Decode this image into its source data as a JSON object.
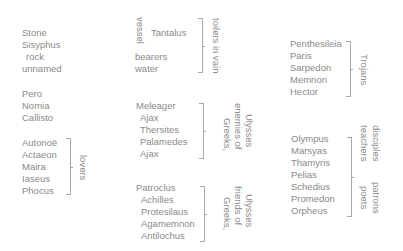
{
  "groups": {
    "sisyphus": {
      "items": [
        "Stone",
        "Sisyphus",
        "rock",
        "unnamed"
      ]
    },
    "women": {
      "items": [
        "Pero",
        "Nomia",
        "Callisto"
      ]
    },
    "lovers": {
      "items": [
        "Autonoë",
        "Actaeon",
        "Maira",
        "Iaseus",
        "Phocus"
      ],
      "label": "lovers"
    },
    "toilers": {
      "vessel": "vessel",
      "items": [
        "Tantalus",
        "bearers",
        "water"
      ],
      "label": "toilers in vain"
    },
    "enemies": {
      "items": [
        "Meleager",
        "Ajax",
        "Thersites",
        "Palamedes",
        "Ajax"
      ],
      "label_lines": [
        "Greeks,",
        "enemies of",
        "Ulysses"
      ]
    },
    "friends": {
      "items": [
        "Patroclus",
        "Achilles",
        "Protesilaus",
        "Agamemnon",
        "Antilochus"
      ],
      "label_lines": [
        "Greeks,",
        "friends of",
        "Ulysses"
      ]
    },
    "trojans": {
      "items": [
        "Penthesileia",
        "Paris",
        "Sarpedon",
        "Memnon",
        "Hector"
      ],
      "label": "Trojans"
    },
    "poets": {
      "items": [
        "Olympus",
        "Marsyas",
        "Thamyris",
        "Pelias",
        "Schedius",
        "Promedon",
        "Orpheus"
      ],
      "labels_top": [
        "teachers",
        "disciples"
      ],
      "labels_bottom": [
        "poets",
        "patrons"
      ]
    }
  },
  "colors": {
    "text": "#8a8a8a",
    "bracket": "#a8a8a8",
    "background": "#ffffff"
  }
}
